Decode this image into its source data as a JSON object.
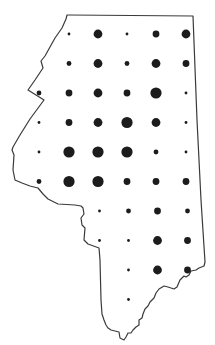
{
  "map": {
    "type": "proportional-symbol",
    "region": "single state outline",
    "symbol_color": "#1c1c1c",
    "outline_color": "#3a3a3a",
    "size_scale": [
      "tiny",
      "small",
      "medium",
      "large",
      "xlarge"
    ],
    "grid": {
      "columns": [
        "c1",
        "c2",
        "c3",
        "c4",
        "c5",
        "c6"
      ],
      "rows": [
        {
          "row": 1,
          "values": [
            null,
            1,
            4,
            1,
            3,
            4
          ]
        },
        {
          "row": 2,
          "values": [
            null,
            2,
            4,
            2,
            4,
            3
          ]
        },
        {
          "row": 3,
          "values": [
            2,
            3,
            4,
            3,
            5,
            1
          ]
        },
        {
          "row": 4,
          "values": [
            1,
            3,
            4,
            5,
            4,
            1
          ]
        },
        {
          "row": 5,
          "values": [
            1,
            5,
            5,
            5,
            2,
            1
          ]
        },
        {
          "row": 6,
          "values": [
            2,
            5,
            5,
            3,
            3,
            3
          ]
        },
        {
          "row": 7,
          "values": [
            null,
            null,
            1,
            2,
            3,
            2
          ]
        },
        {
          "row": 8,
          "values": [
            null,
            null,
            1,
            1,
            4,
            3
          ]
        },
        {
          "row": 9,
          "values": [
            null,
            null,
            null,
            1,
            4,
            3
          ]
        },
        {
          "row": 10,
          "values": [
            null,
            null,
            null,
            1,
            null,
            null
          ]
        }
      ]
    }
  }
}
